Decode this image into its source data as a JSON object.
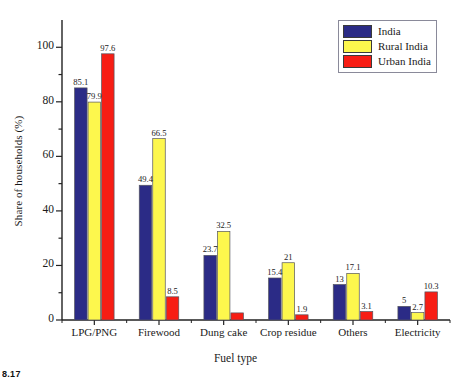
{
  "chart_data": {
    "type": "bar",
    "title": "",
    "xlabel": "Fuel type",
    "ylabel": "Share of households (%)",
    "categories": [
      "LPG/PNG",
      "Firewood",
      "Dung cake",
      "Crop residue",
      "Others",
      "Electricity"
    ],
    "series": [
      {
        "name": "India",
        "color": "#2b2b86",
        "values": [
          85.1,
          49.4,
          23.7,
          15.4,
          13,
          5
        ]
      },
      {
        "name": "Rural India",
        "color": "#fdf74d",
        "values": [
          79.9,
          66.5,
          32.5,
          21,
          17.1,
          2.7
        ]
      },
      {
        "name": "Urban India",
        "color": "#f71d14",
        "values": [
          97.6,
          8.5,
          2.6,
          1.9,
          3.1,
          10.3
        ]
      }
    ],
    "data_labels": [
      [
        "85.1",
        "79.9",
        "97.6"
      ],
      [
        "49.4",
        "66.5",
        "8.5"
      ],
      [
        "23.7",
        "32.5",
        ""
      ],
      [
        "15.4",
        "21",
        "1.9"
      ],
      [
        "13",
        "17.1",
        "3.1"
      ],
      [
        "5",
        "2.7",
        "10.3"
      ]
    ],
    "yticks": [
      "0",
      "20",
      "40",
      "60",
      "80",
      "100"
    ],
    "ylim": [
      0,
      110
    ],
    "grid": false,
    "legend_position": "top-right"
  },
  "legend": {
    "items": [
      {
        "label": "India",
        "color": "#2b2b86"
      },
      {
        "label": "Rural India",
        "color": "#fdf74d"
      },
      {
        "label": "Urban India",
        "color": "#f71d14"
      }
    ]
  },
  "corner_note": "8.17"
}
